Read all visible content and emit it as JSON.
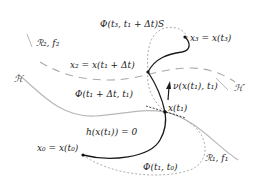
{
  "labels": {
    "region2": "ℛ₂, f₂",
    "region1": "ℛ₁, f₁",
    "surface_h": "ℋ",
    "surface_h_prime": "ℋ′",
    "x2": "x₂ = x(t₁ + Δt)",
    "x3": "x₃ = x(t₃)",
    "x1": "x(t₁)",
    "x0": "x₀ = x(t₀)",
    "phi_t3": "Φ(t₃, t₁ + Δt)S",
    "phi_t1dt": "Φ(t₁ + Δt, t₁)",
    "phi_t1t0": "Φ(t₁, t₀)",
    "h_eq": "h(x(t₁)) = 0",
    "normal": "ν(x(t₁), t₁)"
  },
  "colors": {
    "trajectory": "#1a1a1a",
    "surface": "#b0b0b0",
    "dotted": "#999999",
    "dashed": "#aaaaaa",
    "text": "#222222"
  }
}
